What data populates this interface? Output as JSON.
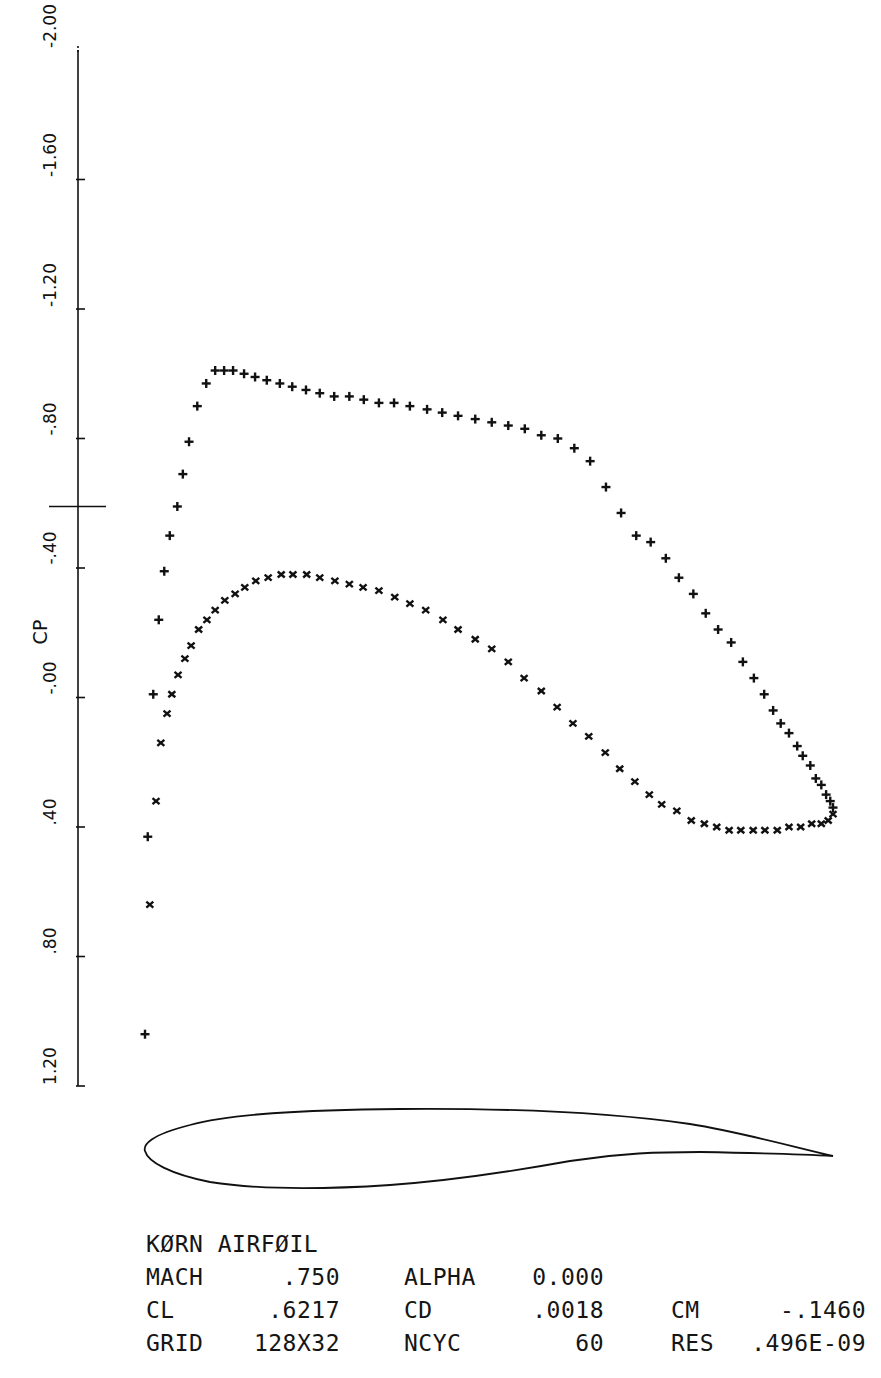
{
  "chart_data": {
    "type": "scatter",
    "xlabel": "",
    "ylabel": "CP",
    "ylim": [
      -2.0,
      1.2
    ],
    "y_inverted": true,
    "grid": false,
    "y_ticks": [
      -2.0,
      -1.6,
      -1.2,
      -0.8,
      -0.4,
      0.0,
      0.4,
      0.8,
      1.2
    ],
    "y_tick_labels": [
      "-2.00",
      "-1.60",
      "-1.20",
      "-.80",
      "-.40",
      "-.00",
      ".40",
      ".80",
      "1.20"
    ],
    "critical_cp_marker": -0.59,
    "x_axis_meaning": "x/c (chord fraction, aligned with airfoil outline below)",
    "series": [
      {
        "name": "upper surface",
        "marker": "+",
        "x": [
          0.0,
          0.004,
          0.012,
          0.02,
          0.028,
          0.036,
          0.047,
          0.055,
          0.064,
          0.076,
          0.089,
          0.102,
          0.115,
          0.128,
          0.144,
          0.16,
          0.177,
          0.196,
          0.214,
          0.234,
          0.254,
          0.275,
          0.297,
          0.318,
          0.34,
          0.362,
          0.385,
          0.41,
          0.432,
          0.455,
          0.48,
          0.504,
          0.528,
          0.552,
          0.576,
          0.6,
          0.624,
          0.647,
          0.67,
          0.692,
          0.714,
          0.735,
          0.757,
          0.776,
          0.797,
          0.815,
          0.833,
          0.852,
          0.869,
          0.885,
          0.9,
          0.913,
          0.924,
          0.936,
          0.948,
          0.956,
          0.967,
          0.975,
          0.983,
          0.99,
          0.996,
          1.0
        ],
        "values": [
          1.04,
          0.43,
          -0.01,
          -0.24,
          -0.39,
          -0.5,
          -0.59,
          -0.69,
          -0.79,
          -0.9,
          -0.97,
          -1.01,
          -1.01,
          -1.01,
          -1.0,
          -0.99,
          -0.98,
          -0.97,
          -0.96,
          -0.95,
          -0.94,
          -0.93,
          -0.93,
          -0.92,
          -0.91,
          -0.91,
          -0.9,
          -0.89,
          -0.88,
          -0.87,
          -0.86,
          -0.85,
          -0.84,
          -0.83,
          -0.81,
          -0.8,
          -0.77,
          -0.73,
          -0.65,
          -0.57,
          -0.5,
          -0.48,
          -0.43,
          -0.37,
          -0.32,
          -0.26,
          -0.21,
          -0.17,
          -0.11,
          -0.06,
          -0.01,
          0.04,
          0.08,
          0.11,
          0.15,
          0.18,
          0.21,
          0.25,
          0.27,
          0.3,
          0.32,
          0.34
        ]
      },
      {
        "name": "lower surface",
        "marker": "x",
        "x": [
          0.007,
          0.016,
          0.023,
          0.032,
          0.039,
          0.048,
          0.058,
          0.067,
          0.078,
          0.09,
          0.102,
          0.116,
          0.131,
          0.145,
          0.161,
          0.179,
          0.198,
          0.215,
          0.235,
          0.254,
          0.276,
          0.297,
          0.317,
          0.34,
          0.363,
          0.385,
          0.408,
          0.433,
          0.455,
          0.48,
          0.504,
          0.528,
          0.551,
          0.576,
          0.599,
          0.622,
          0.645,
          0.669,
          0.69,
          0.712,
          0.733,
          0.751,
          0.773,
          0.794,
          0.813,
          0.831,
          0.849,
          0.866,
          0.884,
          0.901,
          0.919,
          0.936,
          0.953,
          0.969,
          0.983,
          0.993,
          1.0
        ],
        "values": [
          0.64,
          0.32,
          0.14,
          0.05,
          -0.01,
          -0.07,
          -0.12,
          -0.16,
          -0.21,
          -0.24,
          -0.27,
          -0.3,
          -0.32,
          -0.34,
          -0.36,
          -0.37,
          -0.38,
          -0.38,
          -0.38,
          -0.37,
          -0.36,
          -0.35,
          -0.34,
          -0.33,
          -0.31,
          -0.29,
          -0.27,
          -0.24,
          -0.21,
          -0.18,
          -0.15,
          -0.11,
          -0.06,
          -0.02,
          0.03,
          0.08,
          0.12,
          0.17,
          0.22,
          0.26,
          0.3,
          0.33,
          0.35,
          0.38,
          0.39,
          0.4,
          0.41,
          0.41,
          0.41,
          0.41,
          0.41,
          0.4,
          0.4,
          0.39,
          0.39,
          0.38,
          0.36
        ]
      }
    ],
    "annotations": {
      "airfoil_name": "KORN AIRFOIL",
      "MACH": ".750",
      "ALPHA": "0.000",
      "CL": ".6217",
      "CD": ".0018",
      "CM": "-.1460",
      "GRID": "128X32",
      "NCYC": "60",
      "RES": ".496E-09"
    }
  },
  "axis": {
    "ylabel": "CP",
    "ticks": [
      {
        "label": "-2.00",
        "value": -2.0
      },
      {
        "label": "-1.60",
        "value": -1.6
      },
      {
        "label": "-1.20",
        "value": -1.2
      },
      {
        "label": "-.80",
        "value": -0.8
      },
      {
        "label": "-.40",
        "value": -0.4
      },
      {
        "label": "-.00",
        "value": 0.0
      },
      {
        "label": ".40",
        "value": 0.4
      },
      {
        "label": ".80",
        "value": 0.8
      },
      {
        "label": "1.20",
        "value": 1.2
      }
    ]
  },
  "info": {
    "title": "KØRN AIRFØIL",
    "rows": [
      {
        "k1": "MACH",
        "v1": ".750",
        "k2": "ALPHA",
        "v2": "0.000",
        "k3": "",
        "v3": ""
      },
      {
        "k1": "CL",
        "v1": ".6217",
        "k2": "CD",
        "v2": ".0018",
        "k3": "CM",
        "v3": "-.1460"
      },
      {
        "k1": "GRID",
        "v1": "128X32",
        "k2": "NCYC",
        "v2": "60",
        "k3": "RES",
        "v3": ".496E-09"
      }
    ]
  },
  "colors": {
    "ink": "#111111",
    "background": "#ffffff"
  }
}
